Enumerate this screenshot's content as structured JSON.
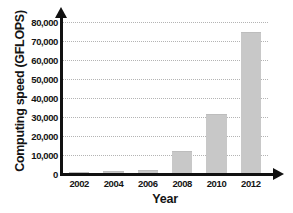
{
  "chart_data": {
    "type": "bar",
    "title": "",
    "xlabel": "Year",
    "ylabel": "Computing speed (GFLOPS)",
    "categories": [
      "2002",
      "2004",
      "2006",
      "2008",
      "2010",
      "2012"
    ],
    "values": [
      250,
      1000,
      1800,
      11500,
      31000,
      74000
    ],
    "series": [
      {
        "name": "Computing speed",
        "values": [
          250,
          1000,
          1800,
          11500,
          31000,
          74000
        ]
      }
    ],
    "ylim": [
      0,
      80000
    ],
    "ytick_labels": [
      "0",
      "10,000",
      "20,000",
      "30,000",
      "40,000",
      "50,000",
      "60,000",
      "70,000",
      "80,000"
    ],
    "ytick_values": [
      0,
      10000,
      20000,
      30000,
      40000,
      50000,
      60000,
      70000,
      80000
    ],
    "grid": true,
    "grid_axis": "y",
    "legend": false,
    "legend_position": "none",
    "bar_color": "#c8c8c8",
    "axis_color": "#111111",
    "gridline_color": "#b4b4b4",
    "text_color": "#141414"
  }
}
